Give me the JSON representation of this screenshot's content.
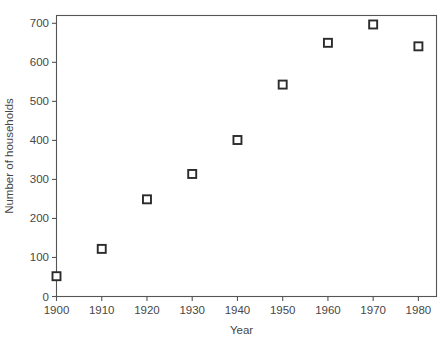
{
  "chart_data": {
    "type": "scatter",
    "title": "",
    "xlabel": "Year",
    "ylabel": "Number of households",
    "x": [
      1900,
      1910,
      1920,
      1930,
      1940,
      1950,
      1960,
      1970,
      1980
    ],
    "values": [
      52,
      122,
      249,
      314,
      401,
      543,
      650,
      697,
      641
    ],
    "series": [
      {
        "name": "Number of households",
        "values": [
          52,
          122,
          249,
          314,
          401,
          543,
          650,
          697,
          641
        ]
      }
    ],
    "points": [
      {
        "x": 1900,
        "y": 52
      },
      {
        "x": 1910,
        "y": 122
      },
      {
        "x": 1920,
        "y": 249
      },
      {
        "x": 1930,
        "y": 314
      },
      {
        "x": 1940,
        "y": 401
      },
      {
        "x": 1950,
        "y": 543
      },
      {
        "x": 1960,
        "y": 650
      },
      {
        "x": 1970,
        "y": 697
      },
      {
        "x": 1980,
        "y": 641
      }
    ],
    "xlim": [
      1900,
      1984
    ],
    "ylim": [
      0,
      720
    ],
    "xticks": [
      1900,
      1910,
      1920,
      1930,
      1940,
      1950,
      1960,
      1970,
      1980
    ],
    "xticklabels": [
      "1900",
      "1910",
      "1920",
      "1930",
      "1940",
      "1950",
      "1960",
      "1970",
      "1980"
    ],
    "yticks": [
      0,
      100,
      200,
      300,
      400,
      500,
      600,
      700
    ],
    "yticklabels": [
      "0",
      "100",
      "200",
      "300",
      "400",
      "500",
      "600",
      "700"
    ],
    "grid": false,
    "legend": null,
    "marker": "open-square",
    "marker_color": "#2b2b2b",
    "marker_fill": "#ffffff",
    "axis_color": "#555555",
    "background_color": "#ffffff"
  }
}
